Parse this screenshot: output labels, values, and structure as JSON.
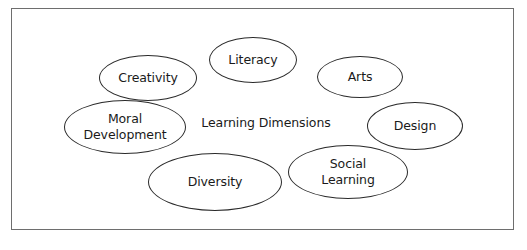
{
  "diagram": {
    "center_label": "Learning Dimensions",
    "nodes": [
      {
        "label": "Creativity",
        "cx": 148,
        "cy": 78,
        "rx": 49,
        "ry": 23
      },
      {
        "label": "Literacy",
        "cx": 253,
        "cy": 60,
        "rx": 44,
        "ry": 23
      },
      {
        "label": "Arts",
        "cx": 360,
        "cy": 77,
        "rx": 43,
        "ry": 21
      },
      {
        "label": "Moral\nDevelopment",
        "cx": 125,
        "cy": 127,
        "rx": 61,
        "ry": 27
      },
      {
        "label": "Design",
        "cx": 415,
        "cy": 126,
        "rx": 48,
        "ry": 24
      },
      {
        "label": "Diversity",
        "cx": 215,
        "cy": 182,
        "rx": 67,
        "ry": 29
      },
      {
        "label": "Social\nLearning",
        "cx": 348,
        "cy": 172,
        "rx": 60,
        "ry": 27
      }
    ],
    "colors": {
      "stroke": "#2a2a2a",
      "frame": "#6e6e6e",
      "text": "#1a1a1a",
      "background": "#ffffff"
    }
  }
}
